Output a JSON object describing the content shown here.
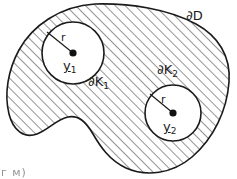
{
  "figure": {
    "kind": "mathematical-diagram",
    "background_color": "#ffffff",
    "ink_color": "#1a1a1a",
    "hatch_color": "#2b2b2b",
    "hole_fill_color": "#ffffff",
    "labels": {
      "outer_boundary": "∂D",
      "hole1_boundary_symbol": "∂K",
      "hole1_boundary_subscript": "1",
      "hole2_boundary_symbol": "∂K",
      "hole2_boundary_subscript": "2",
      "radius1": "r",
      "radius2": "r",
      "center1_symbol": "y",
      "center1_subscript": "1",
      "center2_symbol": "y",
      "center2_subscript": "2",
      "corner_artifact": "г м)"
    },
    "geometry": {
      "hole1": {
        "cx": 73,
        "cy": 53,
        "r": 31
      },
      "hole2": {
        "cx": 173,
        "cy": 113,
        "r": 28
      },
      "hatch_angle_deg": 45,
      "hatch_spacing_px": 7
    }
  }
}
